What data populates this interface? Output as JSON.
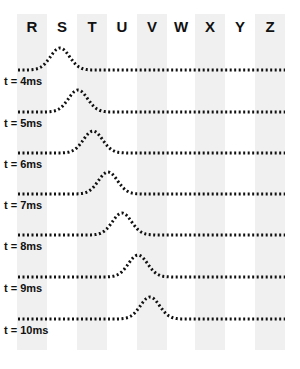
{
  "columns": [
    {
      "label": "R",
      "x": 17,
      "shaded": true
    },
    {
      "label": "S",
      "x": 47,
      "shaded": false
    },
    {
      "label": "T",
      "x": 77,
      "shaded": true
    },
    {
      "label": "U",
      "x": 107,
      "shaded": false
    },
    {
      "label": "V",
      "x": 137,
      "shaded": true
    },
    {
      "label": "W",
      "x": 166,
      "shaded": false
    },
    {
      "label": "X",
      "x": 195,
      "shaded": true
    },
    {
      "label": "Y",
      "x": 225,
      "shaded": false
    },
    {
      "label": "Z",
      "x": 255,
      "shaded": true
    }
  ],
  "waves": [
    {
      "label": "t = 4ms",
      "baseline": 70,
      "peak_x": 60
    },
    {
      "label": "t = 5ms",
      "baseline": 112,
      "peak_x": 78
    },
    {
      "label": "t = 6ms",
      "baseline": 153,
      "peak_x": 93
    },
    {
      "label": "t = 7ms",
      "baseline": 194,
      "peak_x": 108
    },
    {
      "label": "t = 8ms",
      "baseline": 235,
      "peak_x": 122
    },
    {
      "label": "t = 9ms",
      "baseline": 277,
      "peak_x": 138
    },
    {
      "label": "t = 10ms",
      "baseline": 319,
      "peak_x": 150
    }
  ],
  "style": {
    "stroke": "#111111",
    "shade": "#f0f0f0",
    "peak_height": 22,
    "pulse_width": 9
  }
}
